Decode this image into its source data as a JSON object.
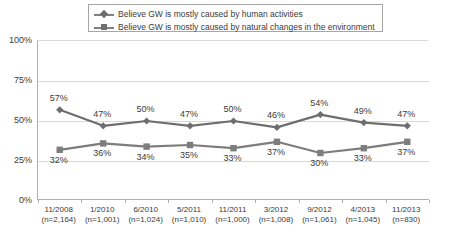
{
  "chart_data": {
    "type": "line",
    "title": "",
    "xlabel": "",
    "ylabel": "",
    "ylim": [
      0,
      100
    ],
    "yticks": [
      "0%",
      "25%",
      "50%",
      "75%",
      "100%"
    ],
    "grid": true,
    "legend_position": "top",
    "categories": [
      "11/2008",
      "1/2010",
      "6/2010",
      "5/2011",
      "11/2011",
      "3/2012",
      "9/2012",
      "4/2013",
      "11/2013"
    ],
    "sample_sizes": [
      "(n=2,164)",
      "(n=1,001)",
      "(n=1,024)",
      "(n=1,010)",
      "(n=1,000)",
      "(n=1,008)",
      "(n=1,061)",
      "(n=1,045)",
      "(n=830)"
    ],
    "series": [
      {
        "name": "Believe GW is mostly caused by human activities",
        "marker": "diamond",
        "color": "#6e6e6e",
        "values": [
          57,
          47,
          50,
          47,
          50,
          46,
          54,
          49,
          47
        ],
        "labels": [
          "57%",
          "47%",
          "50%",
          "47%",
          "50%",
          "46%",
          "54%",
          "49%",
          "47%"
        ]
      },
      {
        "name": "Believe GW is mostly caused by natural changes in the environment",
        "marker": "square",
        "color": "#7d7d7d",
        "values": [
          32,
          36,
          34,
          35,
          33,
          37,
          30,
          33,
          37
        ],
        "labels": [
          "32%",
          "36%",
          "34%",
          "35%",
          "33%",
          "37%",
          "30%",
          "33%",
          "37%"
        ]
      }
    ]
  },
  "colors": {
    "series_human": "#6e6e6e",
    "series_natural": "#7d7d7d",
    "gridline": "#d9d9d9",
    "axis": "#b0b0b0",
    "text": "#3b3b3b",
    "background": "#ffffff"
  }
}
